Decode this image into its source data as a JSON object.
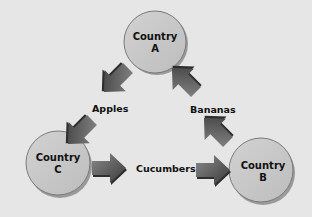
{
  "diagram": {
    "nodes": [
      {
        "id": "A",
        "line1": "Country",
        "line2": "A"
      },
      {
        "id": "B",
        "line1": "Country",
        "line2": "B"
      },
      {
        "id": "C",
        "line1": "Country",
        "line2": "C"
      }
    ],
    "edges": [
      {
        "from": "A",
        "to": "C",
        "label": "Apples"
      },
      {
        "from": "C",
        "to": "B",
        "label": "Cucumbers"
      },
      {
        "from": "B",
        "to": "A",
        "label": "Bananas"
      }
    ],
    "colors": {
      "background": "#e6e6e6",
      "circle_fill": "#c8c8c8",
      "circle_stroke": "#7a7a7a",
      "arrow_dark": "#3a3a3a",
      "arrow_light": "#8a8a8a"
    }
  }
}
